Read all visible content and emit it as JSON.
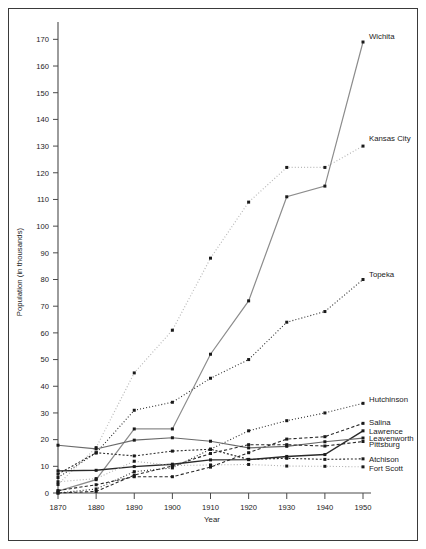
{
  "figure": {
    "background": "#ffffff",
    "frame_color": "#3a3a3a"
  },
  "chart_data": {
    "type": "line",
    "title": "",
    "xlabel": "Year",
    "ylabel": "Population (in thousands)",
    "x": [
      1870,
      1880,
      1890,
      1900,
      1910,
      1920,
      1930,
      1940,
      1950
    ],
    "xlim": [
      1870,
      1950
    ],
    "ylim": [
      0,
      175
    ],
    "yticks": [
      0,
      10,
      20,
      30,
      40,
      50,
      60,
      70,
      80,
      90,
      100,
      110,
      120,
      130,
      140,
      150,
      160,
      170
    ],
    "xticks": [
      1870,
      1880,
      1890,
      1900,
      1910,
      1920,
      1930,
      1940,
      1950
    ],
    "grid": false,
    "legend_position": "right-inline-labels",
    "series": [
      {
        "name": "Wichita",
        "label": "Wichita",
        "color": "#8c8c8c",
        "style": "solid",
        "width": 1.2,
        "values": [
          0.7,
          5,
          24,
          24,
          52,
          72,
          111,
          115,
          169
        ],
        "label_x": 1950,
        "label_y": 171
      },
      {
        "name": "Kansas City",
        "label": "Kansas City",
        "color": "#b8b8b8",
        "style": "dotted",
        "width": 1.2,
        "values": [
          3.2,
          17,
          45,
          61,
          88,
          109,
          122,
          122,
          130
        ],
        "label_x": 1950,
        "label_y": 133
      },
      {
        "name": "Topeka",
        "label": "Topeka",
        "color": "#2a2a2a",
        "style": "dotted",
        "width": 1.1,
        "values": [
          5.8,
          15,
          31,
          34,
          43,
          50,
          64,
          68,
          80
        ],
        "label_x": 1950,
        "label_y": 82
      },
      {
        "name": "Hutchinson",
        "label": "Hutchinson",
        "color": "#2a2a2a",
        "style": "dotted",
        "width": 1.1,
        "values": [
          0,
          1.5,
          8,
          9.4,
          16.4,
          23.3,
          27.1,
          30.0,
          33.6
        ],
        "label_x": 1950,
        "label_y": 35
      },
      {
        "name": "Salina",
        "label": "Salina",
        "color": "#2a2a2a",
        "style": "dashed",
        "width": 1.1,
        "values": [
          0.9,
          3.1,
          6.1,
          6.1,
          9.7,
          15.1,
          20.2,
          21.1,
          26.1
        ],
        "label_x": 1950,
        "label_y": 26.5
      },
      {
        "name": "Lawrence",
        "label": "Lawrence",
        "color": "#2a2a2a",
        "style": "solid",
        "width": 1.4,
        "values": [
          8.3,
          8.5,
          9.9,
          10.8,
          12.4,
          12.5,
          13.7,
          14.4,
          23.3
        ],
        "label_x": 1950,
        "label_y": 23.0
      },
      {
        "name": "Leavenworth",
        "label": "Leavenworth",
        "color": "#6a6a6a",
        "style": "solid",
        "width": 1.2,
        "values": [
          17.9,
          16.5,
          19.8,
          20.7,
          19.4,
          16.9,
          17.5,
          19.2,
          20.6
        ],
        "label_x": 1950,
        "label_y": 20.6
      },
      {
        "name": "Pittsburg",
        "label": "Pittsburg",
        "color": "#2a2a2a",
        "style": "dashed",
        "width": 1.1,
        "values": [
          0,
          0.6,
          6.7,
          10.1,
          14.8,
          18.1,
          18.1,
          17.6,
          19.3
        ],
        "label_x": 1950,
        "label_y": 18.3
      },
      {
        "name": "Atchison",
        "label": "Atchison",
        "color": "#2a2a2a",
        "style": "dashed-fine",
        "width": 1.1,
        "values": [
          7.1,
          15.1,
          13.9,
          15.7,
          16.4,
          12.6,
          13.0,
          12.6,
          12.8
        ],
        "label_x": 1950,
        "label_y": 12.8
      },
      {
        "name": "Fort Scott",
        "label": "Fort Scott",
        "color": "#b0b0b0",
        "style": "dotted",
        "width": 1.1,
        "values": [
          4.2,
          5.4,
          11.9,
          10.3,
          10.5,
          10.7,
          10.1,
          10.0,
          9.8
        ],
        "label_x": 1950,
        "label_y": 9.4
      }
    ]
  }
}
